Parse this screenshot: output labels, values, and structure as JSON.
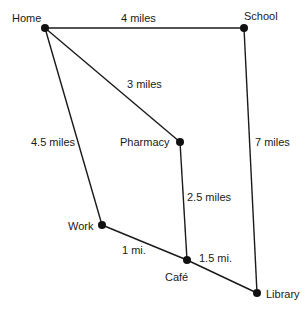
{
  "diagram": {
    "type": "weighted-graph",
    "nodes": [
      {
        "id": "home",
        "label": "Home",
        "x": 45,
        "y": 28,
        "lx": 12,
        "ly": 22,
        "anchor": "start"
      },
      {
        "id": "school",
        "label": "School",
        "x": 244,
        "y": 28,
        "lx": 244,
        "ly": 20,
        "anchor": "start"
      },
      {
        "id": "pharmacy",
        "label": "Pharmacy",
        "x": 180,
        "y": 142,
        "lx": 120,
        "ly": 146,
        "anchor": "start"
      },
      {
        "id": "work",
        "label": "Work",
        "x": 102,
        "y": 225,
        "lx": 68,
        "ly": 230,
        "anchor": "start"
      },
      {
        "id": "cafe",
        "label": "Café",
        "x": 187,
        "y": 260,
        "lx": 165,
        "ly": 281,
        "anchor": "start"
      },
      {
        "id": "library",
        "label": "Library",
        "x": 257,
        "y": 293,
        "lx": 266,
        "ly": 298,
        "anchor": "start"
      }
    ],
    "edges": [
      {
        "from": "home",
        "to": "school",
        "label": "4 miles",
        "lx": 121,
        "ly": 22
      },
      {
        "from": "home",
        "to": "pharmacy",
        "label": "3 miles",
        "lx": 127,
        "ly": 88
      },
      {
        "from": "home",
        "to": "work",
        "label": "4.5 miles",
        "lx": 31,
        "ly": 146
      },
      {
        "from": "school",
        "to": "library",
        "label": "7 miles",
        "lx": 255,
        "ly": 146
      },
      {
        "from": "pharmacy",
        "to": "cafe",
        "label": "2.5 miles",
        "lx": 187,
        "ly": 201
      },
      {
        "from": "work",
        "to": "cafe",
        "label": "1 mi.",
        "lx": 122,
        "ly": 254
      },
      {
        "from": "cafe",
        "to": "library",
        "label": "1.5 mi.",
        "lx": 199,
        "ly": 262
      }
    ]
  }
}
